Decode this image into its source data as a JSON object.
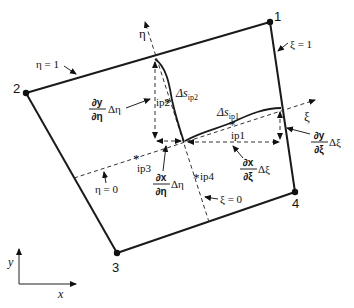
{
  "figure": {
    "nodes": [
      {
        "id": "1",
        "label": "1"
      },
      {
        "id": "2",
        "label": "2"
      },
      {
        "id": "3",
        "label": "3"
      },
      {
        "id": "4",
        "label": "4"
      }
    ],
    "edge_labels": {
      "eta_one": "η = 1",
      "xi_one": "ξ = 1",
      "eta_zero": "η = 0",
      "xi_zero": "ξ = 0"
    },
    "axes": {
      "xi": "ξ",
      "eta": "η",
      "global_x": "x",
      "global_y": "y"
    },
    "integration_points": [
      {
        "label": "ip1"
      },
      {
        "label": "ip2"
      },
      {
        "label": "ip3"
      },
      {
        "label": "ip4"
      }
    ],
    "arc_lengths": {
      "ip1": {
        "base": "Δs",
        "sub": "ip1"
      },
      "ip2": {
        "base": "Δs",
        "sub": "ip2"
      }
    },
    "derivatives": {
      "dy_deta": {
        "num": "∂y",
        "den": "∂η",
        "suffix": "Δη"
      },
      "dx_deta": {
        "num": "∂x",
        "den": "∂η",
        "suffix": "Δη"
      },
      "dy_dxi": {
        "num": "∂y",
        "den": "∂ξ",
        "suffix": "Δξ"
      },
      "dx_dxi": {
        "num": "∂x",
        "den": "∂ξ",
        "suffix": "Δξ"
      }
    },
    "ip_marker": "*"
  }
}
